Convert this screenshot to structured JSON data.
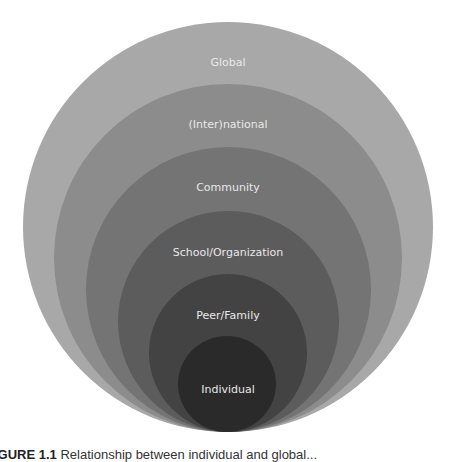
{
  "diagram": {
    "type": "nested-circles",
    "layers": [
      {
        "label": "Global",
        "color": "#a8a8a8"
      },
      {
        "label": "(Inter)national",
        "color": "#8c8c8c"
      },
      {
        "label": "Community",
        "color": "#747474"
      },
      {
        "label": "School/Organization",
        "color": "#5c5c5c"
      },
      {
        "label": "Peer/Family",
        "color": "#434343"
      },
      {
        "label": "Individual",
        "color": "#2a2a2a"
      }
    ]
  },
  "caption": {
    "prefix": "IGURE 1.1",
    "text": "Relationship between individual and global..."
  }
}
